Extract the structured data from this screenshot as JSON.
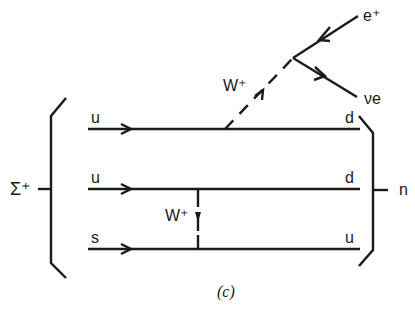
{
  "diagram": {
    "type": "feynman-diagram",
    "initial_particle": "Σ⁺",
    "final_particle": "n",
    "quark_lines": [
      {
        "in": "u",
        "out": "d"
      },
      {
        "in": "u",
        "out": "d"
      },
      {
        "in": "s",
        "out": "u"
      }
    ],
    "boson_upper": "W⁺",
    "boson_inner": "W⁺",
    "lepton_1": "e⁺",
    "lepton_2": "νe",
    "caption": "(c)",
    "line_color": "#1a1a1a"
  }
}
